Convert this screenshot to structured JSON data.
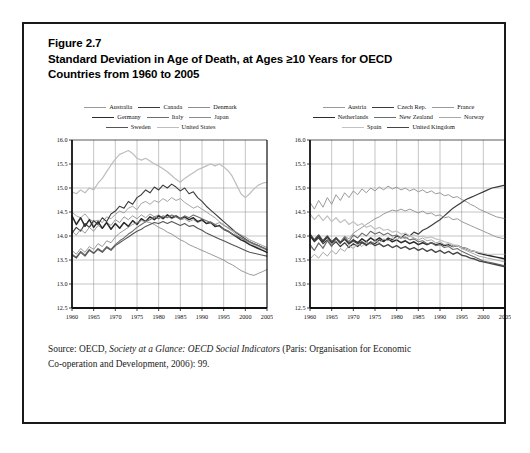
{
  "figure": {
    "number_label": "Figure 2.7",
    "title_line_1": "Standard Deviation in Age of Death, at Ages ≥10 Years for OECD",
    "title_line_2": "Countries from 1960 to 2005",
    "source_prefix": "Source: OECD, ",
    "source_italic": "Society at a Glance: OECD Social Indicators",
    "source_suffix": " (Paris: Organisation for Economic",
    "source_line_2": "Co-operation and Development, 2006): 99."
  },
  "colors": {
    "frame": "#1a1a1a",
    "grid": "#8a8a8a",
    "axis": "#111111",
    "text": "#111111",
    "background": "#ffffff"
  },
  "chart_data": [
    {
      "type": "line",
      "panel": "left",
      "title": "",
      "xlabel": "",
      "ylabel": "",
      "xlim": [
        1960,
        2005
      ],
      "ylim": [
        12.5,
        16.0
      ],
      "yticks": [
        "12.5",
        "13.0",
        "13.5",
        "14.0",
        "14.5",
        "15.0",
        "15.5",
        "16.0"
      ],
      "xticks": [
        "1960",
        "1965",
        "1970",
        "1975",
        "1980",
        "1985",
        "1990",
        "1995",
        "2000",
        "2005"
      ],
      "grid": true,
      "legend_position": "above",
      "x": [
        1960,
        1961,
        1962,
        1963,
        1964,
        1965,
        1966,
        1967,
        1968,
        1969,
        1970,
        1971,
        1972,
        1973,
        1974,
        1975,
        1976,
        1977,
        1978,
        1979,
        1980,
        1981,
        1982,
        1983,
        1984,
        1985,
        1986,
        1987,
        1988,
        1989,
        1990,
        1991,
        1992,
        1993,
        1994,
        1995,
        1996,
        1997,
        1998,
        1999,
        2000,
        2001,
        2002,
        2003,
        2004,
        2005
      ],
      "series": [
        {
          "name": "Australia",
          "color": "#9a9a9a",
          "width": 0.9,
          "values": [
            14.5,
            14.42,
            14.38,
            14.46,
            14.35,
            14.3,
            14.33,
            14.28,
            14.4,
            14.36,
            14.45,
            14.52,
            14.48,
            14.58,
            14.62,
            14.55,
            14.68,
            14.72,
            14.66,
            14.74,
            14.7,
            14.78,
            14.72,
            14.8,
            14.74,
            14.78,
            14.7,
            14.64,
            14.58,
            14.62,
            14.56,
            14.5,
            14.44,
            14.38,
            14.3,
            14.24,
            14.16,
            14.1,
            14.02,
            13.96,
            13.9,
            13.86,
            13.82,
            13.78,
            13.74,
            13.7
          ]
        },
        {
          "name": "Canada",
          "color": "#3c3c3c",
          "width": 1.1,
          "values": [
            14.06,
            14.18,
            14.1,
            14.26,
            14.18,
            14.32,
            14.24,
            14.38,
            14.3,
            14.46,
            14.52,
            14.62,
            14.58,
            14.72,
            14.66,
            14.8,
            14.86,
            14.96,
            14.9,
            15.02,
            14.96,
            15.06,
            15.0,
            15.08,
            15.02,
            14.94,
            15.0,
            14.88,
            14.92,
            14.8,
            14.72,
            14.62,
            14.54,
            14.46,
            14.38,
            14.3,
            14.22,
            14.14,
            14.06,
            14.0,
            13.94,
            13.88,
            13.84,
            13.8,
            13.76,
            13.72
          ]
        },
        {
          "name": "Denmark",
          "color": "#8d8d8d",
          "width": 0.9,
          "values": [
            14.1,
            14.02,
            14.14,
            14.06,
            14.18,
            14.1,
            14.22,
            14.16,
            14.28,
            14.22,
            14.34,
            14.28,
            14.4,
            14.34,
            14.42,
            14.36,
            14.44,
            14.38,
            14.46,
            14.4,
            14.44,
            14.38,
            14.42,
            14.36,
            14.4,
            14.34,
            14.36,
            14.3,
            14.34,
            14.28,
            14.32,
            14.26,
            14.3,
            14.24,
            14.28,
            14.22,
            14.18,
            14.12,
            14.08,
            14.02,
            13.98,
            13.92,
            13.88,
            13.84,
            13.8,
            13.76
          ]
        },
        {
          "name": "Germany",
          "color": "#2b2b2b",
          "width": 1.5,
          "values": [
            14.42,
            14.24,
            14.38,
            14.2,
            14.34,
            14.18,
            14.3,
            14.16,
            14.28,
            14.14,
            14.26,
            14.16,
            14.28,
            14.2,
            14.32,
            14.24,
            14.36,
            14.3,
            14.4,
            14.34,
            14.42,
            14.36,
            14.44,
            14.38,
            14.42,
            14.36,
            14.4,
            14.34,
            14.38,
            14.3,
            14.34,
            14.26,
            14.28,
            14.2,
            14.22,
            14.14,
            14.1,
            14.04,
            13.98,
            13.92,
            13.88,
            13.82,
            13.78,
            13.74,
            13.7,
            13.66
          ]
        },
        {
          "name": "Italy",
          "color": "#6e6e6e",
          "width": 1.1,
          "values": [
            13.62,
            13.56,
            13.68,
            13.6,
            13.72,
            13.64,
            13.74,
            13.68,
            13.78,
            13.72,
            13.82,
            13.9,
            13.96,
            14.04,
            14.1,
            14.18,
            14.24,
            14.3,
            14.34,
            14.4,
            14.36,
            14.42,
            14.38,
            14.44,
            14.4,
            14.36,
            14.42,
            14.38,
            14.44,
            14.4,
            14.36,
            14.32,
            14.28,
            14.24,
            14.2,
            14.14,
            14.1,
            14.04,
            14.0,
            13.96,
            13.92,
            13.88,
            13.84,
            13.8,
            13.76,
            13.72
          ]
        },
        {
          "name": "Japan",
          "color": "#8d8d8d",
          "width": 0.9,
          "values": [
            13.7,
            13.62,
            13.74,
            13.66,
            13.78,
            13.72,
            13.84,
            13.78,
            13.9,
            13.86,
            13.98,
            14.06,
            14.12,
            14.18,
            14.24,
            14.28,
            14.32,
            14.3,
            14.28,
            14.24,
            14.18,
            14.14,
            14.08,
            14.04,
            13.98,
            13.92,
            13.88,
            13.82,
            13.78,
            13.74,
            13.7,
            13.66,
            13.62,
            13.58,
            13.54,
            13.5,
            13.44,
            13.4,
            13.34,
            13.28,
            13.24,
            13.2,
            13.18,
            13.22,
            13.26,
            13.3
          ]
        },
        {
          "name": "Sweden",
          "color": "#555555",
          "width": 1.1,
          "values": [
            13.6,
            13.54,
            13.66,
            13.58,
            13.7,
            13.64,
            13.72,
            13.66,
            13.76,
            13.7,
            13.8,
            13.86,
            13.92,
            13.98,
            14.04,
            14.1,
            14.14,
            14.2,
            14.24,
            14.28,
            14.26,
            14.3,
            14.26,
            14.3,
            14.26,
            14.22,
            14.26,
            14.2,
            14.22,
            14.16,
            14.12,
            14.06,
            14.02,
            13.98,
            13.94,
            13.9,
            13.86,
            13.82,
            13.78,
            13.74,
            13.7,
            13.66,
            13.64,
            13.62,
            13.6,
            13.58
          ]
        },
        {
          "name": "United States",
          "color": "#bdbdbd",
          "width": 1.2,
          "values": [
            14.92,
            14.88,
            14.96,
            14.9,
            15.0,
            14.96,
            15.1,
            15.2,
            15.34,
            15.48,
            15.6,
            15.7,
            15.74,
            15.78,
            15.72,
            15.62,
            15.58,
            15.62,
            15.56,
            15.5,
            15.46,
            15.4,
            15.34,
            15.26,
            15.18,
            15.12,
            15.2,
            15.26,
            15.32,
            15.38,
            15.42,
            15.46,
            15.5,
            15.46,
            15.5,
            15.44,
            15.36,
            15.24,
            15.06,
            14.88,
            14.8,
            14.88,
            14.98,
            15.06,
            15.1,
            15.12
          ]
        }
      ]
    },
    {
      "type": "line",
      "panel": "right",
      "title": "",
      "xlabel": "",
      "ylabel": "",
      "xlim": [
        1960,
        2005
      ],
      "ylim": [
        12.5,
        16.0
      ],
      "yticks": [
        "12.5",
        "13.0",
        "13.5",
        "14.0",
        "14.5",
        "15.0",
        "15.5",
        "16.0"
      ],
      "xticks": [
        "1960",
        "1965",
        "1970",
        "1975",
        "1980",
        "1985",
        "1990",
        "1995",
        "2000",
        "2005"
      ],
      "grid": true,
      "legend_position": "above",
      "x": [
        1960,
        1961,
        1962,
        1963,
        1964,
        1965,
        1966,
        1967,
        1968,
        1969,
        1970,
        1971,
        1972,
        1973,
        1974,
        1975,
        1976,
        1977,
        1978,
        1979,
        1980,
        1981,
        1982,
        1983,
        1984,
        1985,
        1986,
        1987,
        1988,
        1989,
        1990,
        1991,
        1992,
        1993,
        1994,
        1995,
        1996,
        1997,
        1998,
        1999,
        2000,
        2001,
        2002,
        2003,
        2004,
        2005
      ],
      "series": [
        {
          "name": "Austria",
          "color": "#9a9a9a",
          "width": 1.0,
          "values": [
            14.7,
            14.56,
            14.74,
            14.6,
            14.8,
            14.66,
            14.86,
            14.74,
            14.9,
            14.8,
            14.94,
            14.86,
            14.98,
            14.9,
            15.0,
            14.94,
            15.02,
            14.96,
            15.04,
            14.98,
            15.02,
            14.96,
            15.0,
            14.94,
            14.98,
            14.92,
            14.96,
            14.9,
            14.94,
            14.88,
            14.9,
            14.84,
            14.86,
            14.8,
            14.82,
            14.76,
            14.72,
            14.66,
            14.62,
            14.56,
            14.52,
            14.48,
            14.44,
            14.4,
            14.38,
            14.36
          ]
        },
        {
          "name": "Czech Rep.",
          "color": "#3c3c3c",
          "width": 1.2,
          "values": [
            14.0,
            13.88,
            13.96,
            13.84,
            13.92,
            13.8,
            13.88,
            13.78,
            13.86,
            13.76,
            13.84,
            13.78,
            13.86,
            13.8,
            13.88,
            13.84,
            13.92,
            13.88,
            13.96,
            13.92,
            14.0,
            13.96,
            14.04,
            14.0,
            14.08,
            14.04,
            14.12,
            14.16,
            14.22,
            14.28,
            14.34,
            14.42,
            14.5,
            14.58,
            14.64,
            14.7,
            14.76,
            14.8,
            14.84,
            14.88,
            14.92,
            14.96,
            15.0,
            15.02,
            15.04,
            15.06
          ]
        },
        {
          "name": "France",
          "color": "#9a9a9a",
          "width": 1.0,
          "values": [
            13.78,
            13.7,
            13.84,
            13.76,
            13.9,
            13.82,
            13.96,
            13.88,
            14.0,
            13.94,
            14.06,
            14.12,
            14.18,
            14.24,
            14.3,
            14.36,
            14.4,
            14.46,
            14.5,
            14.54,
            14.52,
            14.56,
            14.52,
            14.56,
            14.52,
            14.48,
            14.52,
            14.46,
            14.48,
            14.42,
            14.44,
            14.38,
            14.4,
            14.34,
            14.36,
            14.3,
            14.26,
            14.22,
            14.18,
            14.14,
            14.1,
            14.06,
            14.02,
            13.98,
            13.96,
            13.94
          ]
        },
        {
          "name": "Netherlands",
          "color": "#2b2b2b",
          "width": 1.5,
          "values": [
            14.02,
            13.9,
            14.0,
            13.88,
            13.98,
            13.86,
            13.96,
            13.86,
            13.94,
            13.84,
            13.92,
            13.86,
            13.94,
            13.88,
            13.96,
            13.9,
            13.96,
            13.9,
            13.94,
            13.88,
            13.92,
            13.86,
            13.9,
            13.84,
            13.88,
            13.82,
            13.86,
            13.82,
            13.86,
            13.82,
            13.84,
            13.8,
            13.82,
            13.78,
            13.8,
            13.76,
            13.74,
            13.7,
            13.68,
            13.64,
            13.62,
            13.6,
            13.58,
            13.56,
            13.54,
            13.52
          ]
        },
        {
          "name": "New Zealand",
          "color": "#6e6e6e",
          "width": 1.1,
          "values": [
            13.82,
            13.7,
            13.86,
            13.74,
            13.9,
            13.78,
            13.94,
            13.84,
            13.98,
            13.88,
            14.02,
            13.96,
            14.06,
            14.0,
            14.1,
            14.04,
            14.08,
            14.02,
            14.06,
            14.0,
            14.02,
            13.96,
            13.98,
            13.92,
            13.94,
            13.88,
            13.9,
            13.84,
            13.86,
            13.8,
            13.82,
            13.76,
            13.78,
            13.72,
            13.74,
            13.68,
            13.64,
            13.6,
            13.56,
            13.52,
            13.48,
            13.46,
            13.44,
            13.42,
            13.4,
            13.38
          ]
        },
        {
          "name": "Norway",
          "color": "#a8a8a8",
          "width": 1.0,
          "values": [
            13.52,
            13.62,
            13.54,
            13.66,
            13.58,
            13.7,
            13.62,
            13.74,
            13.68,
            13.8,
            13.74,
            13.84,
            13.78,
            13.88,
            13.82,
            13.9,
            13.86,
            13.94,
            13.9,
            13.96,
            13.92,
            13.98,
            13.94,
            14.0,
            13.96,
            13.92,
            13.96,
            13.9,
            13.92,
            13.86,
            13.88,
            13.82,
            13.84,
            13.78,
            13.8,
            13.74,
            13.7,
            13.66,
            13.62,
            13.58,
            13.56,
            13.54,
            13.52,
            13.5,
            13.48,
            13.46
          ]
        },
        {
          "name": "Spain",
          "color": "#c2c2c2",
          "width": 1.2,
          "values": [
            14.46,
            14.34,
            14.44,
            14.32,
            14.42,
            14.3,
            14.38,
            14.28,
            14.34,
            14.24,
            14.3,
            14.22,
            14.26,
            14.18,
            14.22,
            14.14,
            14.18,
            14.12,
            14.14,
            14.08,
            14.1,
            14.04,
            14.06,
            14.0,
            14.02,
            13.98,
            14.0,
            13.96,
            13.98,
            13.94,
            13.92,
            13.88,
            13.86,
            13.82,
            13.8,
            13.76,
            13.74,
            13.7,
            13.68,
            13.66,
            13.64,
            13.62,
            13.62,
            13.62,
            13.62,
            13.62
          ]
        },
        {
          "name": "United Kingdom",
          "color": "#454545",
          "width": 1.4,
          "values": [
            14.04,
            13.92,
            14.02,
            13.9,
            14.0,
            13.88,
            13.96,
            13.86,
            13.94,
            13.84,
            13.9,
            13.84,
            13.88,
            13.82,
            13.86,
            13.8,
            13.84,
            13.78,
            13.82,
            13.76,
            13.8,
            13.74,
            13.78,
            13.72,
            13.76,
            13.7,
            13.74,
            13.68,
            13.72,
            13.66,
            13.7,
            13.64,
            13.68,
            13.62,
            13.66,
            13.6,
            13.58,
            13.54,
            13.52,
            13.48,
            13.46,
            13.44,
            13.42,
            13.4,
            13.38,
            13.36
          ]
        }
      ]
    }
  ]
}
